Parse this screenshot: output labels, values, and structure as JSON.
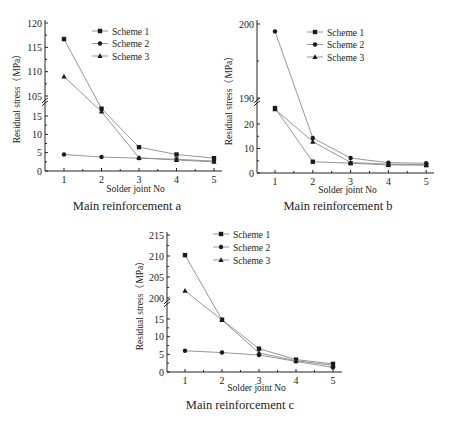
{
  "figure": {
    "background": "#ffffff",
    "line_color": "#8a8a8a",
    "marker_color": "#1a1a1a"
  },
  "chart_data": [
    {
      "type": "line",
      "title": "Main reinforcement a",
      "xlabel": "Solder joint No",
      "ylabel": "Residual stress（MPa）",
      "x": [
        1,
        2,
        3,
        4,
        5
      ],
      "x_ticks": [
        "1",
        "2",
        "3",
        "4",
        "5"
      ],
      "y_axis_break": true,
      "y_lower_ticks": [
        0,
        5,
        10,
        15
      ],
      "y_upper_ticks": [
        105,
        110,
        115,
        120
      ],
      "ylim_lower": [
        0,
        15
      ],
      "ylim_upper": [
        105,
        120
      ],
      "legend": [
        "Scheme 1",
        "Scheme 2",
        "Scheme 3"
      ],
      "legend_position": "upper right",
      "series": [
        {
          "name": "Scheme 1",
          "marker": "square",
          "values": [
            116.7,
            17.0,
            6.5,
            4.5,
            3.5
          ]
        },
        {
          "name": "Scheme 2",
          "marker": "circle",
          "values": [
            4.5,
            3.8,
            3.5,
            3.2,
            2.7
          ]
        },
        {
          "name": "Scheme 3",
          "marker": "triangle",
          "values": [
            109.0,
            16.2,
            3.6,
            3.0,
            2.5
          ]
        }
      ]
    },
    {
      "type": "line",
      "title": "Main reinforcement b",
      "xlabel": "Solder joint No",
      "ylabel": "Residual stress（MPa）",
      "x": [
        1,
        2,
        3,
        4,
        5
      ],
      "x_ticks": [
        "1",
        "2",
        "3",
        "4",
        "5"
      ],
      "y_axis_break": true,
      "y_lower_ticks": [
        0,
        10,
        20
      ],
      "y_upper_ticks": [
        190,
        200
      ],
      "ylim_lower": [
        0,
        20
      ],
      "ylim_upper": [
        190,
        200
      ],
      "legend": [
        "Scheme 1",
        "Scheme 2",
        "Scheme 3"
      ],
      "legend_position": "upper right",
      "series": [
        {
          "name": "Scheme 1",
          "marker": "square",
          "values": [
            26.5,
            4.6,
            4.0,
            3.3,
            3.2
          ]
        },
        {
          "name": "Scheme 2",
          "marker": "circle",
          "values": [
            199.0,
            14.3,
            6.1,
            4.2,
            4.0
          ]
        },
        {
          "name": "Scheme 3",
          "marker": "triangle",
          "values": [
            26.0,
            12.8,
            4.3,
            3.6,
            3.4
          ]
        }
      ]
    },
    {
      "type": "line",
      "title": "Main reinforcement c",
      "xlabel": "Solder joint No",
      "ylabel": "Residual stress（MPa）",
      "x": [
        1,
        2,
        3,
        4,
        5
      ],
      "x_ticks": [
        "1",
        "2",
        "3",
        "4",
        "5"
      ],
      "y_axis_break": true,
      "y_lower_ticks": [
        0,
        5,
        10,
        15
      ],
      "y_upper_ticks": [
        200,
        205,
        210,
        215
      ],
      "ylim_lower": [
        0,
        15
      ],
      "ylim_upper": [
        200,
        215
      ],
      "legend": [
        "Scheme 1",
        "Scheme 2",
        "Scheme 3"
      ],
      "legend_position": "upper right",
      "series": [
        {
          "name": "Scheme 1",
          "marker": "square",
          "values": [
            210.2,
            14.8,
            6.6,
            3.5,
            2.3
          ]
        },
        {
          "name": "Scheme 2",
          "marker": "circle",
          "values": [
            6.0,
            5.5,
            4.8,
            3.0,
            1.3
          ]
        },
        {
          "name": "Scheme 3",
          "marker": "triangle",
          "values": [
            201.7,
            14.7,
            5.4,
            3.2,
            1.9
          ]
        }
      ]
    }
  ]
}
